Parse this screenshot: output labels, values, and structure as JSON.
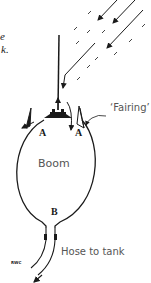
{
  "figure": {
    "caption_fragments": [
      "e",
      "k."
    ],
    "labels": {
      "boom": "Boom",
      "fairing": "‘Fairing’",
      "hose": "Hose to tank",
      "point_a_left": "A",
      "point_a_right": "A",
      "point_b": "B",
      "initials": "RWC"
    },
    "icons": [
      "airflow-arrow-icon",
      "flow-arrow-icon",
      "nozzle-icon"
    ],
    "colors": {
      "ink": "#1a1a1a",
      "label_gray": "#555555",
      "background": "#ffffff"
    }
  }
}
